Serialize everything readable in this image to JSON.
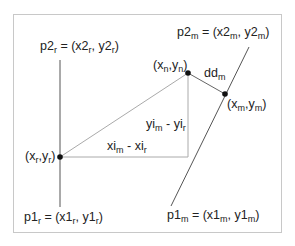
{
  "diagram": {
    "labels": {
      "p2r": {
        "main": "p2",
        "sub": "r",
        "eq": " = (x2",
        "sub2": "r",
        "mid": ", y2",
        "sub3": "r",
        "end": ")"
      },
      "p1r": {
        "main": "p1",
        "sub": "r",
        "eq": " = (x1",
        "sub2": "r",
        "mid": ", y1",
        "sub3": "r",
        "end": ")"
      },
      "p2m": {
        "main": "p2",
        "sub": "m",
        "eq": " = (x2",
        "sub2": "m",
        "mid": ", y2",
        "sub3": "m",
        "end": ")"
      },
      "p1m": {
        "main": "p1",
        "sub": "m",
        "eq": " = (x1",
        "sub2": "m",
        "mid": ", y1",
        "sub3": "m",
        "end": ")"
      },
      "xnyn": {
        "open": "(x",
        "sub": "n",
        "mid": ",y",
        "sub2": "n",
        "end": ")"
      },
      "xmym": {
        "open": "(x",
        "sub": "m",
        "mid": ",y",
        "sub2": "m",
        "end": ")"
      },
      "xryr": {
        "open": "(x",
        "sub": "r",
        "mid": ",y",
        "sub2": "r",
        "end": ")"
      },
      "ddm": {
        "main": "dd",
        "sub": "m"
      },
      "dy": {
        "a": "yi",
        "sub": "m",
        "op": " - ",
        "b": "yi",
        "sub2": "r"
      },
      "dx": {
        "a": "xi",
        "sub": "m",
        "op": " - ",
        "b": "xi",
        "sub2": "r"
      }
    },
    "points": {
      "r": [
        60,
        157
      ],
      "n": [
        188,
        73
      ],
      "m": [
        225,
        94
      ]
    },
    "colors": {
      "line": "#444444",
      "thin": "#999999",
      "frame": "#c8c8c8",
      "point": "#111111"
    }
  }
}
